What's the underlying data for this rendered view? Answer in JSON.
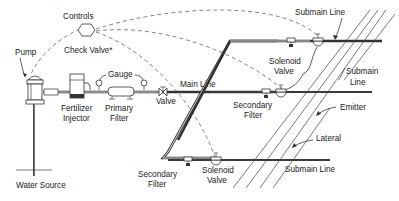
{
  "diagram": {
    "labels": {
      "controls": "Controls",
      "check_valve": "Check Valve*",
      "pump": "Pump",
      "gauge": "Gauge",
      "main_line": "Main Line",
      "valve": "Valve",
      "fertilizer_injector_1": "Fertilizer",
      "fertilizer_injector_2": "Injector",
      "primary_filter_1": "Primary",
      "primary_filter_2": "Filter",
      "water_source": "Water Source",
      "submain_line_top": "Submain Line",
      "solenoid_valve_top_1": "Solenoid",
      "solenoid_valve_top_2": "Valve",
      "submain_line_mid_1": "Submain",
      "submain_line_mid_2": "Line",
      "secondary_filter_mid_1": "Secondary",
      "secondary_filter_mid_2": "Filter",
      "emitter": "Emitter",
      "lateral": "Lateral",
      "secondary_filter_low_1": "Secondary",
      "secondary_filter_low_2": "Filter",
      "solenoid_valve_low_1": "Solenoid",
      "solenoid_valve_low_2": "Valve",
      "submain_line_low": "Submain Line"
    },
    "colors": {
      "line": "#333333",
      "dashed_control": "#666666",
      "background": "#ffffff"
    }
  }
}
